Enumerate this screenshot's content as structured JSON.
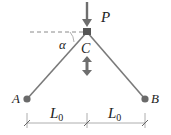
{
  "diagram": {
    "type": "truss-two-bar",
    "labels": {
      "load": "P",
      "angle": "α",
      "joint_top": "C",
      "support_left": "A",
      "support_right": "B",
      "span_left": "L",
      "span_left_sub": "0",
      "span_right": "L",
      "span_right_sub": "0"
    },
    "colors": {
      "member": "#7a7a7a",
      "joint": "#555555",
      "arrow": "#6e6e6e",
      "dimension": "#888888",
      "text": "#222222"
    }
  }
}
